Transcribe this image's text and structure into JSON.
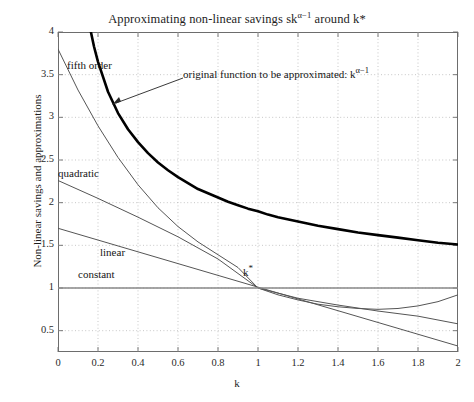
{
  "chart_data": {
    "type": "line",
    "title": "Approximating non-linear savings skα−1 around k*",
    "title_main": "Approximating non-linear savings sk",
    "title_exp": "α−1",
    "title_tail": " around k*",
    "xlabel": "k",
    "ylabel": "Non-linear savings and approximations",
    "xlim": [
      0,
      2
    ],
    "ylim": [
      0.25,
      4
    ],
    "xticks": [
      "0",
      "0.2",
      "0.4",
      "0.6",
      "0.8",
      "1",
      "1.2",
      "1.4",
      "1.6",
      "1.8",
      "2"
    ],
    "xtick_values": [
      0,
      0.2,
      0.4,
      0.6,
      0.8,
      1,
      1.2,
      1.4,
      1.6,
      1.8,
      2
    ],
    "yticks": [
      "0.5",
      "1",
      "1.5",
      "2",
      "2.5",
      "3",
      "3.5",
      "4"
    ],
    "ytick_values": [
      0.5,
      1,
      1.5,
      2,
      2.5,
      3,
      3.5,
      4
    ],
    "grid": true,
    "grid_style": "dotted",
    "grid_color": "#b9b9b9",
    "legend": "inline-labels",
    "series": [
      {
        "name": "original function to be approximated",
        "label": "original function",
        "expression": "k^(alpha-1)",
        "color": "#000000",
        "width": 2.6,
        "x": [
          0.12,
          0.14,
          0.16,
          0.18,
          0.2,
          0.25,
          0.3,
          0.35,
          0.4,
          0.45,
          0.5,
          0.55,
          0.6,
          0.65,
          0.7,
          0.75,
          0.8,
          0.85,
          0.9,
          0.95,
          1.0,
          1.05,
          1.1,
          1.2,
          1.3,
          1.4,
          1.5,
          1.6,
          1.7,
          1.8,
          1.9,
          2.0
        ],
        "y": [
          4.66,
          4.31,
          4.05,
          3.83,
          3.65,
          3.3,
          3.05,
          2.86,
          2.71,
          2.58,
          2.47,
          2.38,
          2.3,
          2.23,
          2.16,
          2.11,
          2.06,
          2.01,
          1.97,
          1.93,
          1.9,
          1.86,
          1.83,
          1.78,
          1.73,
          1.69,
          1.65,
          1.62,
          1.59,
          1.56,
          1.53,
          1.51
        ]
      },
      {
        "name": "fifth order approximation",
        "label": "fifth order",
        "color": "#555555",
        "width": 1.0,
        "x": [
          0,
          0.1,
          0.2,
          0.3,
          0.4,
          0.5,
          0.6,
          0.7,
          0.8,
          0.9,
          1.0,
          1.1,
          1.2,
          1.3,
          1.4,
          1.5,
          1.6,
          1.7,
          1.8,
          1.9,
          2.0
        ],
        "y": [
          3.8,
          3.32,
          2.9,
          2.53,
          2.21,
          1.94,
          1.72,
          1.54,
          1.39,
          1.24,
          1.0,
          0.92,
          0.86,
          0.81,
          0.78,
          0.76,
          0.75,
          0.76,
          0.79,
          0.84,
          0.92
        ]
      },
      {
        "name": "quadratic approximation",
        "label": "quadratic",
        "color": "#555555",
        "width": 1.0,
        "x": [
          0,
          0.2,
          0.4,
          0.6,
          0.8,
          1.0,
          1.2,
          1.4,
          1.6,
          1.8,
          2.0
        ],
        "y": [
          2.26,
          2.05,
          1.83,
          1.6,
          1.34,
          1.0,
          0.88,
          0.8,
          0.73,
          0.67,
          0.58
        ]
      },
      {
        "name": "linear approximation",
        "label": "linear",
        "color": "#555555",
        "width": 1.0,
        "x": [
          0,
          2.0
        ],
        "y": [
          1.7,
          0.32
        ]
      },
      {
        "name": "constant approximation",
        "label": "constant",
        "color": "#888888",
        "width": 1.4,
        "x": [
          0,
          2.0
        ],
        "y": [
          1.0,
          1.0
        ]
      }
    ],
    "annotations": [
      {
        "name": "original-function-annotation",
        "text_main": "original function to be approximated: k",
        "text_exp": "α−1",
        "text": "original function to be approximated: k α−1",
        "arrow_from": [
          183,
          78
        ],
        "arrow_to": [
          112,
          105
        ]
      },
      {
        "name": "kstar-marker",
        "text_main": "k",
        "text_exp": "*",
        "text": "k*",
        "at": [
          1.0,
          1.0
        ]
      }
    ]
  },
  "labels": {
    "fifth_order": "fifth order",
    "quadratic": "quadratic",
    "linear": "linear",
    "constant": "constant",
    "kstar_main": "k",
    "kstar_sup": "*"
  },
  "colors": {
    "background": "#ffffff",
    "axis": "#6d6d6d",
    "text": "#1a1a1a",
    "grid": "#b9b9b9",
    "original_curve": "#000000",
    "approximation": "#555555",
    "constant_line": "#888888"
  }
}
